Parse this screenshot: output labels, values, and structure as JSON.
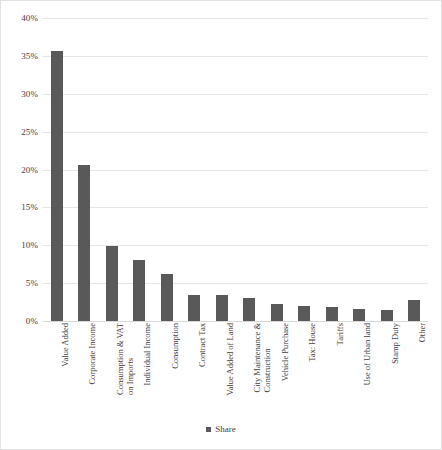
{
  "chart_data": {
    "type": "bar",
    "title": "",
    "subtitle": "",
    "xlabel": "",
    "ylabel": "",
    "ylim": [
      0,
      40
    ],
    "ytick_values": [
      0,
      5,
      10,
      15,
      20,
      25,
      30,
      35,
      40
    ],
    "ytick_labels": [
      "0%",
      "5%",
      "10%",
      "15%",
      "20%",
      "25%",
      "30%",
      "35%",
      "40%"
    ],
    "grid": true,
    "legend_position": "bottom",
    "legend": [
      "Share"
    ],
    "series": [
      {
        "name": "Share",
        "color": "#595959",
        "values": [
          35.7,
          20.6,
          9.9,
          8.1,
          6.2,
          3.4,
          3.4,
          3.1,
          2.3,
          2.0,
          1.9,
          1.6,
          1.4,
          2.8
        ]
      }
    ],
    "categories": [
      "Value Added",
      "Corporate Income",
      "Consumption & VAT on Imports",
      "Individual Income",
      "Consumption",
      "Contract Tax",
      "Value Added of Land",
      "City Maintenance & Construction",
      "Vehicle Purchase",
      "Tax: House",
      "Tariffs",
      "Use of Urban land",
      "Stamp Duty",
      "Other"
    ],
    "category_lines": [
      [
        "Value Added"
      ],
      [
        "Corporate Income"
      ],
      [
        "Consumption & VAT",
        "on Imports"
      ],
      [
        "Individual Income"
      ],
      [
        "Consumption"
      ],
      [
        "Contract Tax"
      ],
      [
        "Value Added of Land"
      ],
      [
        "City Maintenance &",
        "Construction"
      ],
      [
        "Vehicle Purchase"
      ],
      [
        "Tax: House"
      ],
      [
        "Tariffs"
      ],
      [
        "Use of Urban land"
      ],
      [
        "Stamp Duty"
      ],
      [
        "Other"
      ]
    ]
  },
  "colors": {
    "bar": "#595959",
    "grid": "#e6e6e6",
    "border": "#e2e2e2",
    "text": "#44403c",
    "background": "#ffffff"
  },
  "legend": {
    "label": "Share"
  }
}
